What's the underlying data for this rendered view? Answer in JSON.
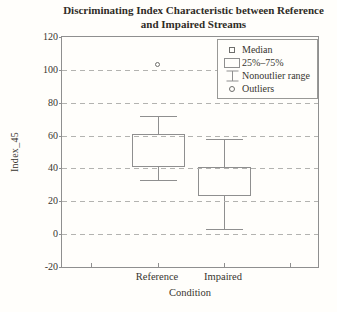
{
  "figure": {
    "title_line1": "Discriminating Index Characteristic between Reference",
    "title_line2": "and Impaired Streams"
  },
  "chart_data": {
    "type": "boxplot",
    "title": "Discriminating Index Characteristic between Reference and Impaired Streams",
    "xlabel": "Condition",
    "ylabel": "Index_45",
    "categories": [
      "Reference",
      "Impaired"
    ],
    "ylim": [
      -20,
      120
    ],
    "y_ticks": [
      120,
      100,
      80,
      60,
      40,
      20,
      0,
      -20
    ],
    "x_tick_fractions": [
      0.113,
      0.375,
      0.633,
      0.891
    ],
    "grid": "horizontal-dashed",
    "legend": [
      "Median",
      "25%–75%",
      "Nonoutlier range",
      "Outliers"
    ],
    "legend_position": "top-right",
    "series": [
      {
        "name": "Reference",
        "x_frac": 0.375,
        "median": 51,
        "q1": 41,
        "q3": 61,
        "whisker_low": 33,
        "whisker_high": 72,
        "outliers": [
          103
        ]
      },
      {
        "name": "Impaired",
        "x_frac": 0.633,
        "median": 34,
        "q1": 23,
        "q3": 41,
        "whisker_low": 3,
        "whisker_high": 58,
        "outliers": []
      }
    ],
    "box_width": 53,
    "cap_width": 37,
    "colors": {
      "line": "#8f8f8f",
      "grid": "#b3b3b0",
      "text": "#38352f",
      "background": "#fffefb"
    }
  }
}
